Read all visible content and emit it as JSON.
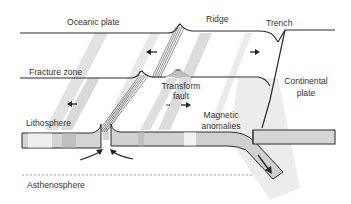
{
  "diagram": {
    "labels": {
      "oceanic_plate": "Oceanic plate",
      "ridge": "Ridge",
      "trench": "Trench",
      "fracture_zone": "Fracture zone",
      "transform_fault_line1": "Transform",
      "transform_fault_line2": "fault",
      "continental_plate_line1": "Continental",
      "continental_plate_line2": "plate",
      "lithosphere": "Lithosphere",
      "magnetic_anomalies_line1": "Magnetic",
      "magnetic_anomalies_line2": "anomalies",
      "asthenosphere": "Asthenosphere"
    },
    "colors": {
      "line": "#2a2a2a",
      "band_light": "#e6e6e6",
      "band_mid": "#cfcfcf",
      "band_dark": "#bdbdbd",
      "stripe": "#d9d9d9",
      "text": "#333333",
      "dashed": "#8a8a8a"
    }
  }
}
